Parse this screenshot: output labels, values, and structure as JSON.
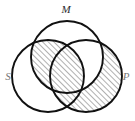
{
  "diagram": {
    "type": "venn-3",
    "background_color": "#ffffff",
    "stroke_color": "#111111",
    "hatch_color": "#3a3a3a",
    "labels": {
      "top": "M",
      "left": "S",
      "right": "P"
    },
    "circles": [
      {
        "id": "M",
        "label": "M",
        "cx": 67,
        "cy": 57,
        "r": 36,
        "position": "top"
      },
      {
        "id": "S",
        "label": "S",
        "cx": 48,
        "cy": 76,
        "r": 36,
        "position": "lower-left"
      },
      {
        "id": "P",
        "label": "P",
        "cx": 86,
        "cy": 76,
        "r": 36,
        "position": "lower-right"
      }
    ],
    "label_positions": [
      {
        "id": "M",
        "text": "M",
        "x": 66,
        "y": 13,
        "faint": false
      },
      {
        "id": "S",
        "text": "S",
        "x": 8,
        "y": 77,
        "faint": true
      },
      {
        "id": "P",
        "text": "P",
        "x": 124,
        "y": 77,
        "faint": true
      }
    ],
    "shaded_regions": [
      {
        "id": "S-and-M-not-P",
        "description": "Intersection of S and M excluding P",
        "hatched": true
      },
      {
        "id": "S-and-M-and-P",
        "description": "Intersection of S, M and P",
        "hatched": true
      },
      {
        "id": "P-not-M",
        "description": "Region of P outside M",
        "hatched": true
      }
    ],
    "hatch": {
      "direction": "forward-slash",
      "angle_degrees": 45,
      "spacing_px": 4,
      "line_width_px": 0.8
    }
  }
}
